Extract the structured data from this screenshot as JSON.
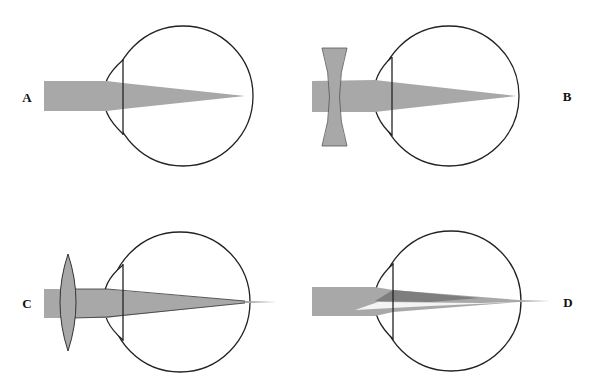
{
  "figure": {
    "colors": {
      "background": "#ffffff",
      "outline": "#222222",
      "beam": "#a8a8a8",
      "lens": "#a8a8a8",
      "beam_dark": "#7e7e7e",
      "beam_light": "#f4f4f4"
    },
    "panels": [
      {
        "id": "A",
        "label": "A",
        "description": "Eye with parallel light focused on the retina"
      },
      {
        "id": "B",
        "label": "B",
        "description": "Eye with concave (diverging) corrective lens, light focused on the retina"
      },
      {
        "id": "C",
        "label": "C",
        "description": "Eye with convex (converging) corrective lens, focus extending beyond the retina"
      },
      {
        "id": "D",
        "label": "D",
        "description": "Eye with split beams focusing at different points (astigmatism)"
      }
    ]
  }
}
